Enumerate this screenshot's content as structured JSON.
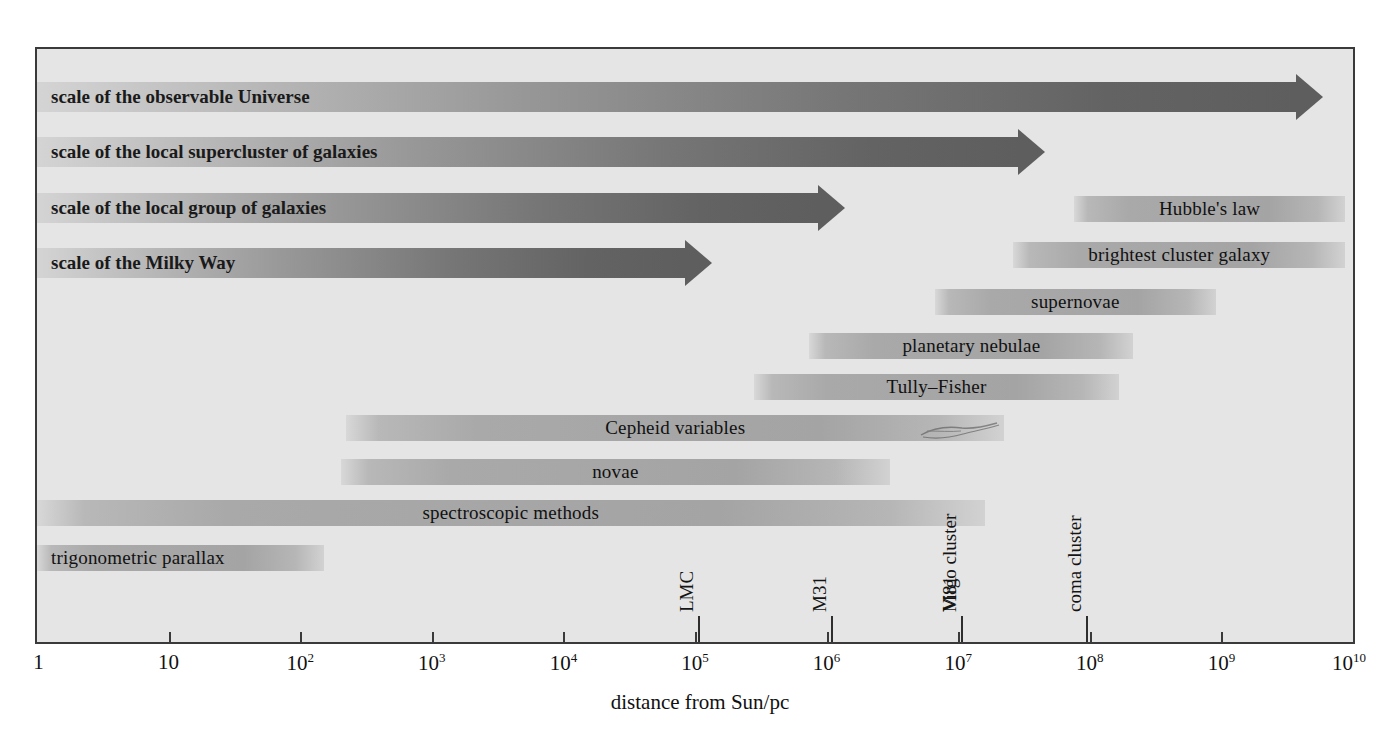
{
  "figure": {
    "xlabel": "distance from Sun/pc",
    "frame_color": "#3a3a3a",
    "background": "#e5e5e5"
  },
  "axis": {
    "ticks": [
      {
        "label": "1",
        "exp": "",
        "value": 0
      },
      {
        "label": "10",
        "exp": "",
        "value": 1
      },
      {
        "label": "10",
        "exp": "2",
        "value": 2
      },
      {
        "label": "10",
        "exp": "3",
        "value": 3
      },
      {
        "label": "10",
        "exp": "4",
        "value": 4
      },
      {
        "label": "10",
        "exp": "5",
        "value": 5
      },
      {
        "label": "10",
        "exp": "6",
        "value": 6
      },
      {
        "label": "10",
        "exp": "7",
        "value": 7
      },
      {
        "label": "10",
        "exp": "8",
        "value": 8
      },
      {
        "label": "10",
        "exp": "9",
        "value": 9
      },
      {
        "label": "10",
        "exp": "10",
        "value": 10
      }
    ]
  },
  "objects": [
    {
      "name": "LMC",
      "value": 5.02
    },
    {
      "name": "M31",
      "value": 6.03
    },
    {
      "name": "M81",
      "value": 7.02
    },
    {
      "name": "Virgo cluster",
      "value": 7.02
    },
    {
      "name": "coma cluster",
      "value": 7.97
    }
  ],
  "arrows": [
    {
      "label": "scale of the observable Universe",
      "start": 0,
      "end": 9.77
    },
    {
      "label": "scale of the local supercluster of galaxies",
      "start": 0,
      "end": 7.66
    },
    {
      "label": "scale of the local group of galaxies",
      "start": 0,
      "end": 6.14
    },
    {
      "label": "scale of the Milky Way",
      "start": 0,
      "end": 5.13
    }
  ],
  "methods": [
    {
      "label": "Hubble's law",
      "start": 7.88,
      "end": 9.94,
      "align": "center"
    },
    {
      "label": "brightest cluster galaxy",
      "start": 7.42,
      "end": 9.94,
      "align": "center"
    },
    {
      "label": "supernovae",
      "start": 6.82,
      "end": 8.96,
      "align": "center"
    },
    {
      "label": "planetary nebulae",
      "start": 5.87,
      "end": 8.33,
      "align": "center"
    },
    {
      "label": "Tully–Fisher",
      "start": 5.45,
      "end": 8.22,
      "align": "center"
    },
    {
      "label": "Cepheid variables",
      "start": 2.35,
      "end": 7.35,
      "align": "center"
    },
    {
      "label": "novae",
      "start": 2.31,
      "end": 6.48,
      "align": "center"
    },
    {
      "label": "spectroscopic methods",
      "start": 0.0,
      "end": 7.2,
      "align": "center"
    },
    {
      "label": "trigonometric parallax",
      "start": 0.0,
      "end": 2.18,
      "align": "left"
    }
  ],
  "chart_data": {
    "type": "bar",
    "xlabel": "distance from Sun/pc",
    "ylabel": "",
    "xscale": "log",
    "xlim": [
      1,
      10000000000
    ],
    "xtick_labels": [
      "1",
      "10",
      "10^2",
      "10^3",
      "10^4",
      "10^5",
      "10^6",
      "10^7",
      "10^8",
      "10^9",
      "10^10"
    ],
    "grid": false,
    "legend": "none",
    "orientation": "horizontal-ranges",
    "series": [
      {
        "name": "scale of the observable Universe",
        "kind": "arrow",
        "range_pc": [
          1,
          5900000000.0
        ]
      },
      {
        "name": "scale of the local supercluster of galaxies",
        "kind": "arrow",
        "range_pc": [
          1,
          46000000.0
        ]
      },
      {
        "name": "scale of the local group of galaxies",
        "kind": "arrow",
        "range_pc": [
          1,
          1400000.0
        ]
      },
      {
        "name": "scale of the Milky Way",
        "kind": "arrow",
        "range_pc": [
          1,
          130000.0
        ]
      },
      {
        "name": "Hubble's law",
        "kind": "range",
        "range_pc": [
          76000000.0,
          8700000000.0
        ]
      },
      {
        "name": "brightest cluster galaxy",
        "kind": "range",
        "range_pc": [
          26000000.0,
          8700000000.0
        ]
      },
      {
        "name": "supernovae",
        "kind": "range",
        "range_pc": [
          6600000.0,
          910000000.0
        ]
      },
      {
        "name": "planetary nebulae",
        "kind": "range",
        "range_pc": [
          740000.0,
          210000000.0
        ]
      },
      {
        "name": "Tully–Fisher",
        "kind": "range",
        "range_pc": [
          280000.0,
          170000000.0
        ]
      },
      {
        "name": "Cepheid variables",
        "kind": "range",
        "range_pc": [
          220.0,
          22000000.0
        ]
      },
      {
        "name": "novae",
        "kind": "range",
        "range_pc": [
          200.0,
          3000000.0
        ]
      },
      {
        "name": "spectroscopic methods",
        "kind": "range",
        "range_pc": [
          1,
          16000000.0
        ]
      },
      {
        "name": "trigonometric parallax",
        "kind": "range",
        "range_pc": [
          1,
          150.0
        ]
      }
    ],
    "annotations": [
      {
        "text": "LMC",
        "x_pc": 105000.0
      },
      {
        "text": "M31",
        "x_pc": 1070000.0
      },
      {
        "text": "M81",
        "x_pc": 10500000.0
      },
      {
        "text": "Virgo cluster",
        "x_pc": 10500000.0
      },
      {
        "text": "coma cluster",
        "x_pc": 93000000.0
      }
    ]
  }
}
